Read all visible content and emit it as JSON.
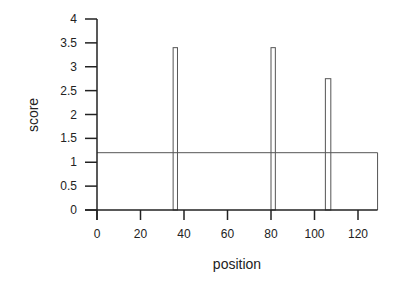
{
  "chart_data": {
    "type": "bar",
    "title": "",
    "xlabel": "position",
    "ylabel": "score",
    "xlim": [
      0,
      129
    ],
    "ylim": [
      0,
      4
    ],
    "x_ticks": [
      "0",
      "20",
      "40",
      "60",
      "80",
      "100",
      "120"
    ],
    "y_ticks": [
      "0",
      "0.5",
      "1",
      "1.5",
      "2",
      "2.5",
      "3",
      "3.5",
      "4"
    ],
    "grid": false,
    "legend": null,
    "series": [
      {
        "name": "score",
        "type": "bar",
        "bars": [
          {
            "x_start": 35,
            "x_end": 37,
            "value": 3.4
          },
          {
            "x_start": 80,
            "x_end": 82,
            "value": 3.4
          },
          {
            "x_start": 105,
            "x_end": 107.5,
            "value": 2.75
          }
        ]
      },
      {
        "name": "threshold",
        "type": "step",
        "x_start": 0,
        "x_end": 129,
        "value": 1.2
      }
    ]
  }
}
